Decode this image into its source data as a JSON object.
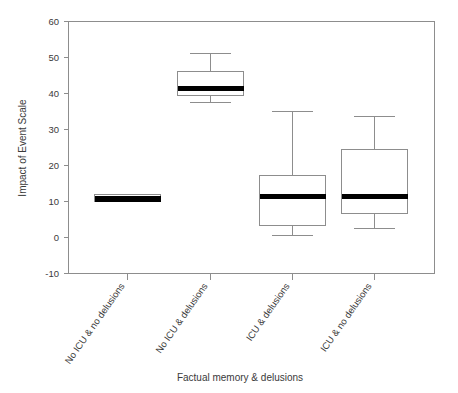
{
  "chart_data": {
    "type": "box",
    "title": "",
    "xlabel": "Factual memory & delusions",
    "ylabel": "Impact of Event Scale",
    "ylim": [
      -10,
      60
    ],
    "yticks": [
      -10,
      0,
      10,
      20,
      30,
      40,
      50,
      60
    ],
    "ytick_labels": [
      "-10",
      "0",
      "10",
      "20",
      "30",
      "40",
      "50",
      "60"
    ],
    "grid": false,
    "legend": "none",
    "categories": [
      "No ICU & no delusions",
      "No ICU & delusions",
      "ICU & delusions",
      "ICU & no delusions"
    ],
    "boxes": [
      {
        "category": "No ICU & no delusions",
        "whisker_low": 10.0,
        "q1": 10.0,
        "median": 10.7,
        "q3": 11.9,
        "whisker_high": 11.9
      },
      {
        "category": "No ICU & delusions",
        "whisker_low": 37.5,
        "q1": 39.5,
        "median": 41.3,
        "q3": 46.0,
        "whisker_high": 51.0
      },
      {
        "category": "ICU & delusions",
        "whisker_low": 0.5,
        "q1": 3.2,
        "median": 11.3,
        "q3": 17.3,
        "whisker_high": 35.0
      },
      {
        "category": "ICU & no delusions",
        "whisker_low": 2.5,
        "q1": 6.6,
        "median": 11.5,
        "q3": 24.4,
        "whisker_high": 33.5
      }
    ]
  },
  "colors": {
    "axis": "#8d8d8d",
    "median": "#000000",
    "box_fill": "#ffffff",
    "text": "#3a3a3a",
    "background": "#ffffff"
  },
  "axis": {
    "y_title": "Impact of Event Scale",
    "x_title": "Factual memory & delusions",
    "y_ticks": {
      "t60": "60",
      "t50": "50",
      "t40": "40",
      "t30": "30",
      "t20": "20",
      "t10": "10",
      "t0": "0",
      "tm10": "-10"
    }
  },
  "category_labels": {
    "c1": "No ICU & no delusions",
    "c2": "No ICU & delusions",
    "c3": "ICU & delusions",
    "c4": "ICU & no delusions"
  }
}
